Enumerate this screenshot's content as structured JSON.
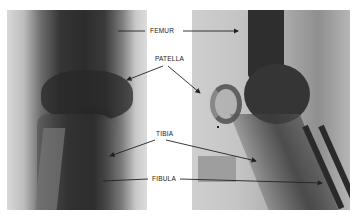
{
  "figure": {
    "panels": [
      {
        "id": "left",
        "view": "frontal"
      },
      {
        "id": "right",
        "view": "lateral"
      }
    ],
    "labels": {
      "femur": "FEMUR",
      "patella": "PATELLA",
      "tibia": "TIBIA",
      "fibula": "FIBULA"
    },
    "colors": {
      "background": "#ffffff",
      "label_text": "#222222",
      "arrow": "#222222"
    }
  }
}
